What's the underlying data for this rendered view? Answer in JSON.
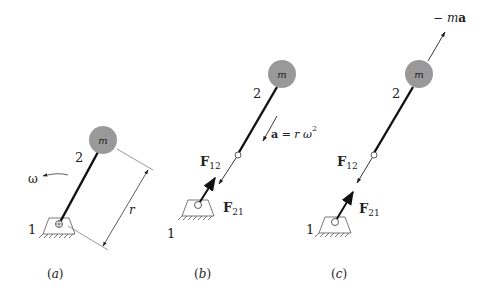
{
  "figure": {
    "panels": [
      {
        "id": "a",
        "caption": "(a)",
        "mass_label": "m",
        "link_label": "2",
        "ground_label": "1",
        "omega_label": "ω",
        "radius_label": "r"
      },
      {
        "id": "b",
        "caption": "(b)",
        "mass_label": "m",
        "link_label": "2",
        "ground_label": "1",
        "f12_main": "F",
        "f12_sub": "12",
        "f21_main": "F",
        "f21_sub": "21",
        "accel_bold": "a",
        "accel_eq": " = r ω",
        "accel_sup": "2"
      },
      {
        "id": "c",
        "caption": "(c)",
        "mass_label": "m",
        "link_label": "2",
        "ground_label": "1",
        "f12_main": "F",
        "f12_sub": "12",
        "f21_main": "F",
        "f21_sub": "21",
        "inertia_prefix": "− ",
        "inertia_m": "m",
        "inertia_a": "a"
      }
    ],
    "colors": {
      "mass_fill": "#999999",
      "link": "#111111",
      "thin_line": "#333333"
    }
  }
}
